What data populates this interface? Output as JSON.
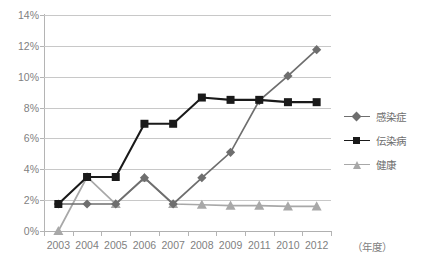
{
  "chart_data": {
    "type": "line",
    "title": "",
    "xlabel": "（年度）",
    "ylabel": "",
    "categories": [
      "2003",
      "2004",
      "2005",
      "2006",
      "2007",
      "2008",
      "2009",
      "2011",
      "2010",
      "2012"
    ],
    "ylim": [
      0,
      14
    ],
    "ytick_labels": [
      "0%",
      "2%",
      "4%",
      "6%",
      "8%",
      "10%",
      "12%",
      "14%"
    ],
    "ytick_values": [
      0,
      2,
      4,
      6,
      8,
      10,
      12,
      14
    ],
    "grid": true,
    "legend_position": "right",
    "series": [
      {
        "name": "感染症",
        "marker": "diamond",
        "color": "#6e6e6e",
        "values": [
          1.75,
          1.75,
          1.75,
          3.45,
          1.75,
          3.45,
          5.1,
          8.45,
          10.05,
          11.75
        ]
      },
      {
        "name": "伝染病",
        "marker": "square",
        "color": "#1a1a1a",
        "values": [
          1.75,
          3.5,
          3.5,
          6.95,
          6.95,
          8.65,
          8.5,
          8.5,
          8.35,
          8.35
        ]
      },
      {
        "name": "健康",
        "marker": "triangle",
        "color": "#a8a8a8",
        "values": [
          0.0,
          3.5,
          1.75,
          3.45,
          1.75,
          1.7,
          1.65,
          1.65,
          1.6,
          1.6
        ]
      }
    ]
  },
  "axis": {
    "unit_label": "（年度）"
  },
  "legend": {
    "items": [
      {
        "label": "感染症"
      },
      {
        "label": "伝染病"
      },
      {
        "label": "健康"
      }
    ]
  },
  "colors": {
    "series_1": "#6e6e6e",
    "series_2": "#1a1a1a",
    "series_3": "#a8a8a8",
    "gridline": "#c8c8c8",
    "axis": "#b4b4b4",
    "text": "#7f7f7f",
    "background": "#ffffff"
  }
}
